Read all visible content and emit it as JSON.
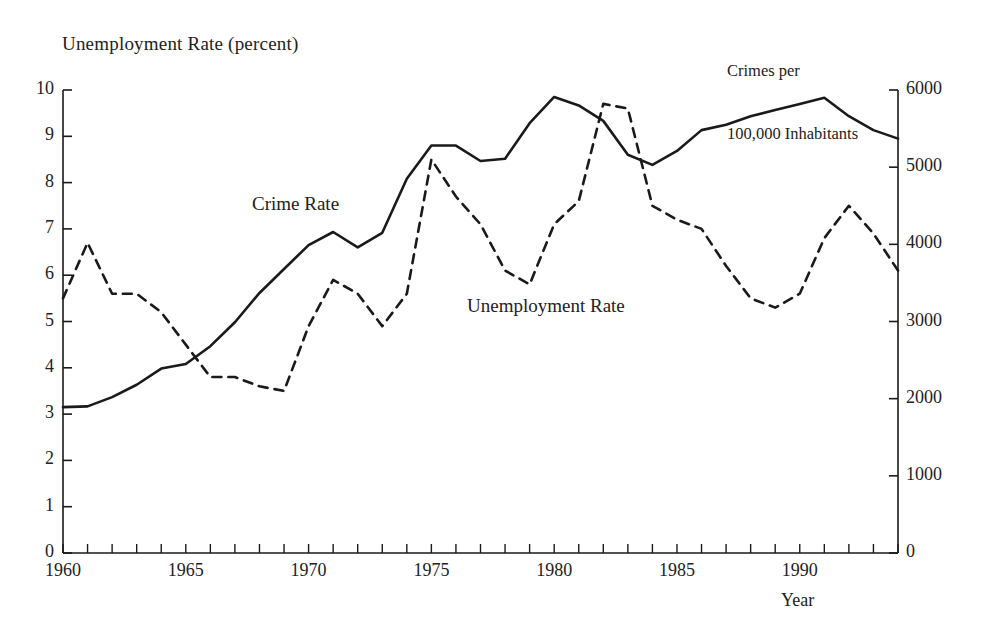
{
  "figure": {
    "left_axis_title": "Unemployment Rate (percent)",
    "right_axis_title_line1": "Crimes per",
    "right_axis_title_line2": "100,000 Inhabitants",
    "x_axis_title": "Year",
    "series_label_crime": "Crime Rate",
    "series_label_unemployment": "Unemployment Rate"
  },
  "chart_data": {
    "type": "line",
    "title": "",
    "subtitle": "",
    "xlabel": "Year",
    "ylabel": "Unemployment Rate (percent)",
    "y2label": "Crimes per 100,000 Inhabitants",
    "xlim": [
      1960,
      1994
    ],
    "ylim": [
      0,
      10
    ],
    "y2lim": [
      0,
      6000
    ],
    "grid": false,
    "legend": "inline-annotations",
    "x_tick_labels": [
      "1960",
      "1965",
      "1970",
      "1975",
      "1980",
      "1985",
      "1990"
    ],
    "x_tick_values": [
      1960,
      1965,
      1970,
      1975,
      1980,
      1985,
      1990
    ],
    "x_minor_tick_step": 1,
    "y_left_tick_labels": [
      "0",
      "1",
      "2",
      "3",
      "4",
      "5",
      "6",
      "7",
      "8",
      "9",
      "10"
    ],
    "y_left_tick_values": [
      0,
      1,
      2,
      3,
      4,
      5,
      6,
      7,
      8,
      9,
      10
    ],
    "y_right_tick_labels": [
      "0",
      "1000",
      "2000",
      "3000",
      "4000",
      "5000",
      "6000"
    ],
    "y_right_tick_values": [
      0,
      1000,
      2000,
      3000,
      4000,
      5000,
      6000
    ],
    "x": [
      1960,
      1961,
      1962,
      1963,
      1964,
      1965,
      1966,
      1967,
      1968,
      1969,
      1970,
      1971,
      1972,
      1973,
      1974,
      1975,
      1976,
      1977,
      1978,
      1979,
      1980,
      1981,
      1982,
      1983,
      1984,
      1985,
      1986,
      1987,
      1988,
      1989,
      1990,
      1991,
      1992,
      1993,
      1994
    ],
    "series": [
      {
        "name": "Crime Rate",
        "axis": "right",
        "units": "crimes per 100,000 inhabitants",
        "linestyle": "solid",
        "color": "#1a1a1a",
        "values": [
          1890,
          1900,
          2020,
          2180,
          2390,
          2450,
          2680,
          2990,
          3370,
          3680,
          3990,
          4160,
          3960,
          4150,
          4850,
          5280,
          5280,
          5080,
          5110,
          5570,
          5910,
          5800,
          5600,
          5160,
          5030,
          5210,
          5480,
          5550,
          5660,
          5740,
          5820,
          5900,
          5660,
          5480,
          5370
        ],
        "values_left_scale_equivalent": [
          3.15,
          3.17,
          3.37,
          3.63,
          3.98,
          4.08,
          4.47,
          4.98,
          5.62,
          6.13,
          6.65,
          6.93,
          6.6,
          6.92,
          8.08,
          8.8,
          8.8,
          8.47,
          8.52,
          9.28,
          9.85,
          9.67,
          9.33,
          8.6,
          8.38,
          8.68,
          9.13,
          9.25,
          9.43,
          9.57,
          9.7,
          9.83,
          9.43,
          9.13,
          8.95
        ]
      },
      {
        "name": "Unemployment Rate",
        "axis": "left",
        "units": "percent",
        "linestyle": "dashed",
        "color": "#1a1a1a",
        "values": [
          5.5,
          6.7,
          5.6,
          5.6,
          5.2,
          4.5,
          3.8,
          3.8,
          3.6,
          3.5,
          4.9,
          5.9,
          5.6,
          4.9,
          5.6,
          8.5,
          7.7,
          7.1,
          6.1,
          5.8,
          7.1,
          7.6,
          9.7,
          9.6,
          7.5,
          7.2,
          7.0,
          6.2,
          5.5,
          5.3,
          5.6,
          6.8,
          7.5,
          6.9,
          6.1
        ]
      }
    ]
  }
}
